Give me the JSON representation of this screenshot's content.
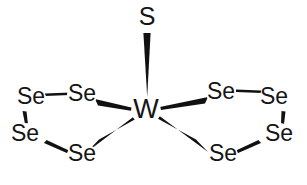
{
  "figure": {
    "kind": "chemical-structure-diagram",
    "title": "",
    "background_color": "#ffffff",
    "bond_color": "#111111",
    "label_color": "#151515",
    "width": 307,
    "height": 185
  },
  "atoms": [
    {
      "id": "S1",
      "label": "S",
      "x": 147,
      "y": 18,
      "font_size": 25
    },
    {
      "id": "W1",
      "label": "W",
      "x": 146,
      "y": 111,
      "font_size": 27
    },
    {
      "id": "SeL1",
      "label": "Se",
      "x": 31,
      "y": 98,
      "font_size": 23
    },
    {
      "id": "SeL2",
      "label": "Se",
      "x": 82,
      "y": 95,
      "font_size": 23
    },
    {
      "id": "SeL3",
      "label": "Se",
      "x": 25,
      "y": 135,
      "font_size": 23
    },
    {
      "id": "SeL4",
      "label": "Se",
      "x": 82,
      "y": 155,
      "font_size": 23
    },
    {
      "id": "SeR1",
      "label": "Se",
      "x": 221,
      "y": 93,
      "font_size": 23
    },
    {
      "id": "SeR2",
      "label": "Se",
      "x": 274,
      "y": 98,
      "font_size": 23
    },
    {
      "id": "SeR3",
      "label": "Se",
      "x": 279,
      "y": 135,
      "font_size": 23
    },
    {
      "id": "SeR4",
      "label": "Se",
      "x": 223,
      "y": 155,
      "font_size": 23
    }
  ],
  "bonds": [
    {
      "id": "b-S-W",
      "from": "S1",
      "to": "W1",
      "style": "wedge",
      "note": "solid wedge, wide at S, point at W"
    },
    {
      "id": "b-W-SeL2",
      "from": "W1",
      "to": "SeL2",
      "style": "wedge",
      "note": "solid wedge, wide at Se, point at W"
    },
    {
      "id": "b-W-SeL4",
      "from": "W1",
      "to": "SeL4",
      "style": "wedge",
      "note": "solid wedge, wide at Se, point at W"
    },
    {
      "id": "b-W-SeR1",
      "from": "W1",
      "to": "SeR1",
      "style": "wedge",
      "note": "solid wedge, wide at Se, point at W"
    },
    {
      "id": "b-W-SeR4",
      "from": "W1",
      "to": "SeR4",
      "style": "wedge",
      "note": "solid wedge, wide at Se, point at W"
    },
    {
      "id": "b-SeL1-SeL2",
      "from": "SeL1",
      "to": "SeL2",
      "style": "line",
      "note": "short horizontal bond"
    },
    {
      "id": "b-SeL1-SeL3",
      "from": "SeL1",
      "to": "SeL3",
      "style": "line",
      "note": "short steep bond"
    },
    {
      "id": "b-SeL3-SeL4",
      "from": "SeL3",
      "to": "SeL4",
      "style": "line",
      "note": "short descending bond"
    },
    {
      "id": "b-SeR1-SeR2",
      "from": "SeR1",
      "to": "SeR2",
      "style": "line",
      "note": "short horizontal bond"
    },
    {
      "id": "b-SeR2-SeR3",
      "from": "SeR2",
      "to": "SeR3",
      "style": "line",
      "note": "short steep bond"
    },
    {
      "id": "b-SeR3-SeR4",
      "from": "SeR3",
      "to": "SeR4",
      "style": "line",
      "note": "short descending bond"
    }
  ]
}
